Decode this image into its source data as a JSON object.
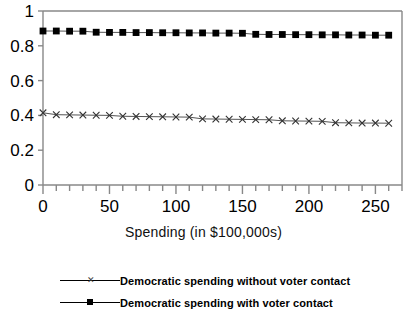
{
  "chart_data": {
    "type": "line",
    "title": "",
    "xlabel": "Spending (in $100,000s)",
    "ylabel": "",
    "xlim": [
      0,
      270
    ],
    "ylim": [
      0,
      1
    ],
    "grid": false,
    "legend_position": "bottom-left",
    "x_ticks_major": [
      0,
      50,
      100,
      150,
      200,
      250
    ],
    "x_tick_labels": [
      "0",
      "50",
      "100",
      "150",
      "200",
      "250"
    ],
    "x_tick_minor_step": 10,
    "y_ticks": [
      0,
      0.2,
      0.4,
      0.6,
      0.8,
      1
    ],
    "y_tick_labels": [
      "0",
      "0.2",
      "0.4",
      "0.6",
      "0.8",
      "1"
    ],
    "x": [
      0,
      10,
      20,
      30,
      40,
      50,
      60,
      70,
      80,
      90,
      100,
      110,
      120,
      130,
      140,
      150,
      160,
      170,
      180,
      190,
      200,
      210,
      220,
      230,
      240,
      250,
      260
    ],
    "series": [
      {
        "name": "Democratic spending with voter contact",
        "marker": "square",
        "values": [
          0.885,
          0.885,
          0.884,
          0.884,
          0.878,
          0.877,
          0.877,
          0.876,
          0.876,
          0.875,
          0.875,
          0.874,
          0.874,
          0.873,
          0.873,
          0.872,
          0.866,
          0.865,
          0.865,
          0.864,
          0.864,
          0.863,
          0.863,
          0.862,
          0.862,
          0.861,
          0.861
        ]
      },
      {
        "name": "Democratic spending without voter contact",
        "marker": "x",
        "values": [
          0.415,
          0.404,
          0.403,
          0.402,
          0.401,
          0.4,
          0.395,
          0.394,
          0.393,
          0.392,
          0.391,
          0.39,
          0.38,
          0.379,
          0.378,
          0.377,
          0.376,
          0.375,
          0.369,
          0.368,
          0.367,
          0.366,
          0.358,
          0.357,
          0.356,
          0.356,
          0.355
        ]
      }
    ]
  },
  "legend": {
    "items": [
      {
        "label": "Democratic spending without voter contact",
        "marker": "x"
      },
      {
        "label": "Democratic spending with voter contact",
        "marker": "square"
      }
    ]
  },
  "axis": {
    "x_title": "Spending (in $100,000s)"
  }
}
